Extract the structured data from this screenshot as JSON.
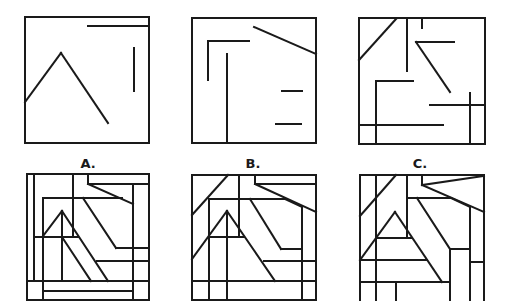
{
  "figure": {
    "stroke_color": "#1a1a1a",
    "stroke_width": 2,
    "background": "#ffffff",
    "fragments": [
      {
        "name": "fragment-1",
        "box": [
          25,
          17,
          149,
          143
        ],
        "lines": [
          [
            88,
            26,
            149,
            26
          ],
          [
            134,
            48,
            134,
            91
          ],
          [
            25,
            102,
            61,
            53
          ],
          [
            61,
            53,
            108,
            123
          ]
        ]
      },
      {
        "name": "fragment-2",
        "box": [
          192,
          18,
          316,
          143
        ],
        "lines": [
          [
            254,
            27,
            316,
            54
          ],
          [
            208,
            41,
            249,
            41
          ],
          [
            208,
            41,
            208,
            80
          ],
          [
            227,
            54,
            227,
            143
          ],
          [
            282,
            91,
            302,
            91
          ],
          [
            276,
            124,
            301,
            124
          ]
        ]
      },
      {
        "name": "fragment-3",
        "box": [
          359,
          18,
          485,
          144
        ],
        "lines": [
          [
            359,
            60,
            396,
            19
          ],
          [
            407,
            19,
            407,
            71
          ],
          [
            422,
            19,
            422,
            28
          ],
          [
            416,
            42,
            454,
            42
          ],
          [
            416,
            42,
            450,
            92
          ],
          [
            376,
            81,
            413,
            81
          ],
          [
            376,
            81,
            376,
            144
          ],
          [
            430,
            105,
            485,
            105
          ],
          [
            470,
            93,
            470,
            144
          ],
          [
            359,
            125,
            443,
            125
          ]
        ]
      }
    ],
    "options": [
      {
        "label": "A.",
        "label_pos": [
          88,
          158
        ],
        "box": [
          27,
          174,
          149,
          300
        ],
        "lines": [
          [
            34,
            174,
            34,
            281
          ],
          [
            27,
            281,
            149,
            281
          ],
          [
            43,
            198,
            43,
            300
          ],
          [
            43,
            198,
            122,
            198
          ],
          [
            73,
            174,
            73,
            237
          ],
          [
            34,
            237,
            78,
            237
          ],
          [
            88,
            174,
            88,
            184
          ],
          [
            88,
            184,
            149,
            184
          ],
          [
            88,
            184,
            133,
            204
          ],
          [
            133,
            184,
            133,
            300
          ],
          [
            62,
            211,
            43,
            236
          ],
          [
            62,
            211,
            108,
            281
          ],
          [
            62,
            211,
            62,
            281
          ],
          [
            62,
            237,
            91,
            281
          ],
          [
            83,
            198,
            116,
            248
          ],
          [
            116,
            248,
            149,
            248
          ],
          [
            97,
            261,
            149,
            261
          ],
          [
            43,
            291,
            133,
            291
          ]
        ]
      },
      {
        "label": "B.",
        "label_pos": [
          253,
          158
        ],
        "box": [
          192,
          175,
          316,
          300
        ],
        "lines": [
          [
            228,
            175,
            192,
            215
          ],
          [
            239,
            175,
            239,
            237
          ],
          [
            255,
            175,
            255,
            184
          ],
          [
            255,
            184,
            316,
            184
          ],
          [
            255,
            184,
            316,
            212
          ],
          [
            209,
            199,
            285,
            199
          ],
          [
            285,
            199,
            302,
            207
          ],
          [
            302,
            207,
            302,
            301
          ],
          [
            209,
            199,
            209,
            301
          ],
          [
            227,
            211,
            192,
            259
          ],
          [
            227,
            211,
            275,
            281
          ],
          [
            209,
            237,
            244,
            237
          ],
          [
            227,
            211,
            227,
            301
          ],
          [
            250,
            199,
            281,
            249
          ],
          [
            281,
            249,
            302,
            249
          ],
          [
            264,
            261,
            316,
            261
          ],
          [
            192,
            281,
            316,
            281
          ]
        ]
      },
      {
        "label": "C.",
        "label_pos": [
          420,
          158
        ],
        "box": [
          360,
          175,
          484,
          302
        ],
        "lines": [
          [
            376,
            175,
            376,
            301
          ],
          [
            396,
            175,
            360,
            216
          ],
          [
            407,
            175,
            407,
            238
          ],
          [
            376,
            238,
            412,
            238
          ],
          [
            422,
            175,
            422,
            185
          ],
          [
            422,
            185,
            484,
            176
          ],
          [
            422,
            185,
            484,
            212
          ],
          [
            407,
            198,
            451,
            198
          ],
          [
            451,
            198,
            470,
            207
          ],
          [
            470,
            207,
            470,
            301
          ],
          [
            395,
            212,
            360,
            260
          ],
          [
            395,
            212,
            442,
            282
          ],
          [
            360,
            260,
            427,
            260
          ],
          [
            417,
            198,
            450,
            249
          ],
          [
            450,
            249,
            470,
            249
          ],
          [
            450,
            249,
            450,
            301
          ],
          [
            470,
            262,
            484,
            262
          ],
          [
            360,
            282,
            450,
            282
          ],
          [
            396,
            282,
            396,
            301
          ]
        ]
      }
    ]
  }
}
